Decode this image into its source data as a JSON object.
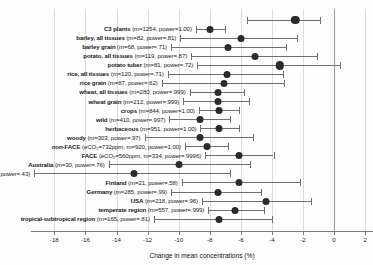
{
  "figure": {
    "xaxis_title": "Change in mean concentrations (%)",
    "tick_labels": [
      "-18",
      "-16",
      "-14",
      "-12",
      "-10",
      "-8",
      "-6",
      "-4",
      "-2",
      "0",
      "2"
    ],
    "colors": {
      "point": "#2b2b2b",
      "whisker": "#6f6f6f",
      "gridline": "#dcdcdc",
      "zeroline": "#9a9a9a",
      "axis": "#7b7b7b",
      "text": "#1b1b1b",
      "background": "#fdfdfd"
    }
  },
  "chart_data": {
    "type": "scatter",
    "title": "",
    "xlabel": "Change in mean concentrations (%)",
    "ylabel": "",
    "xlim": [
      -19.5,
      2.5
    ],
    "xticks": [
      -18,
      -16,
      -14,
      -12,
      -10,
      -8,
      -6,
      -4,
      -2,
      0,
      2
    ],
    "grid": true,
    "legend": false,
    "orientation": "horizontal-forest-plot",
    "reference_line": 0,
    "rows": [
      {
        "name": "",
        "stats": "",
        "label_bold": "",
        "label_rest": "",
        "value": -2.5,
        "low": -5.6,
        "high": -0.9,
        "marker": "large"
      },
      {
        "name": "C3 plants",
        "stats": "(m=1254, power=1.00)",
        "label_bold": "C3 plants",
        "label_rest": " (m=1254, power=1.00)",
        "value": -8.0,
        "low": -8.9,
        "high": -7.0,
        "marker": "normal"
      },
      {
        "name": "barley, all tissues",
        "stats": "(m=82, power=.81)",
        "label_bold": "barley, all tissues",
        "label_rest": " (m=82, power=.81)",
        "value": -6.0,
        "low": -9.9,
        "high": -2.4,
        "marker": "normal"
      },
      {
        "name": "barley grain",
        "stats": "(m=68, power=.71)",
        "label_bold": "barley grain",
        "label_rest": " (m=68, power=.71)",
        "value": -6.8,
        "low": -10.5,
        "high": -3.1,
        "marker": "normal"
      },
      {
        "name": "potato, all tissues",
        "stats": "(m=119, power=.87)",
        "label_bold": "potato, all tissues",
        "label_rest": " (m=119, power=.87)",
        "value": -5.1,
        "low": -9.2,
        "high": -1.1,
        "marker": "normal"
      },
      {
        "name": "potato tuber",
        "stats": "(m=81, power=.72)",
        "label_bold": "potato tuber",
        "label_rest": " (m=81, power=.72)",
        "value": -3.5,
        "low": -8.8,
        "high": 0.4,
        "marker": "large"
      },
      {
        "name": "rice, all tissues",
        "stats": "(m=120, power=.71)",
        "label_bold": "rice, all tissues",
        "label_rest": " (m=120, power=.71)",
        "value": -6.9,
        "low": -10.7,
        "high": -3.3,
        "marker": "normal"
      },
      {
        "name": "rice grain",
        "stats": "(m=87, power=.62)",
        "label_bold": "rice grain",
        "label_rest": " (m=87, power=.62)",
        "value": -7.1,
        "low": -11.1,
        "high": -3.2,
        "marker": "normal"
      },
      {
        "name": "wheat, all tissues",
        "stats": "(m=280, power=.999)",
        "label_bold": "wheat, all tissues",
        "label_rest": " (m=280, power=.999)",
        "value": -7.5,
        "low": -9.3,
        "high": -5.8,
        "marker": "normal"
      },
      {
        "name": "wheat grain",
        "stats": "(m=212, power=.999)",
        "label_bold": "wheat grain",
        "label_rest": " (m=212, power=.999)",
        "value": -7.5,
        "low": -9.7,
        "high": -5.5,
        "marker": "normal"
      },
      {
        "name": "crops",
        "stats": "(m=844, power=1.00)",
        "label_bold": "crops",
        "label_rest": " (m=844, power=1.00)",
        "value": -7.4,
        "low": -8.7,
        "high": -6.1,
        "marker": "normal"
      },
      {
        "name": "wild",
        "stats": "(m=410, power=.997)",
        "label_bold": "wild",
        "label_rest": " (m=410, power=.997)",
        "value": -8.6,
        "low": -10.6,
        "high": -6.7,
        "marker": "normal"
      },
      {
        "name": "herbaceous",
        "stats": "(m=951, power=1.00)",
        "label_bold": "herbaceous",
        "label_rest": " (m=951, power=1.00)",
        "value": -7.4,
        "low": -8.6,
        "high": -6.1,
        "marker": "normal"
      },
      {
        "name": "woody",
        "stats": "(m=303, power=.97)",
        "label_bold": "woody",
        "label_rest": " (m=303, power=.97)",
        "value": -8.6,
        "low": -12.2,
        "high": -5.2,
        "marker": "normal"
      },
      {
        "name": "non-FACE",
        "stats": "(eCO₂=732ppm, m=920, power=1.00)",
        "label_bold": "non-FACE",
        "label_rest": " (eCO₂=732ppm, m=920, power=1.00)",
        "value": -8.2,
        "low": -9.6,
        "high": -6.8,
        "marker": "normal"
      },
      {
        "name": "FACE",
        "stats": "(eCO₂=560ppm, m=334, power=.9996)",
        "label_bold": "FACE",
        "label_rest": " (eCO₂=560ppm, m=334, power=.9996)",
        "value": -6.1,
        "low": -8.3,
        "high": -3.9,
        "marker": "normal"
      },
      {
        "name": "Australia",
        "stats": "(m=30, power=.76)",
        "label_bold": "Australia",
        "label_rest": " (m=30, power=.76)",
        "value": -10.0,
        "low": -14.5,
        "high": -5.4,
        "marker": "normal"
      },
      {
        "name": "China",
        "stats": "(m=45, power=.43)",
        "label_bold": "China",
        "label_rest": " (m=45, power=.43)",
        "value": -12.9,
        "low": -19.3,
        "high": -6.7,
        "marker": "normal"
      },
      {
        "name": "Finland",
        "stats": "(m=21, power=.58)",
        "label_bold": "Finland",
        "label_rest": " (m=21, power=.58)",
        "value": -6.1,
        "low": -9.8,
        "high": -2.2,
        "marker": "normal"
      },
      {
        "name": "Germany",
        "stats": "(m=285, power=.99)",
        "label_bold": "Germany",
        "label_rest": " (m=285, power=.99)",
        "value": -7.5,
        "low": -10.5,
        "high": -4.7,
        "marker": "normal"
      },
      {
        "name": "USA",
        "stats": "(m=218, power=.96)",
        "label_bold": "USA",
        "label_rest": " (m=218, power=.96)",
        "value": -4.4,
        "low": -8.5,
        "high": -1.5,
        "marker": "normal"
      },
      {
        "name": "temperate region",
        "stats": "(m=557, power=.999)",
        "label_bold": "temperate region",
        "label_rest": " (m=557, power=.999)",
        "value": -6.4,
        "low": -8.1,
        "high": -4.5,
        "marker": "normal"
      },
      {
        "name": "tropical-subtropical region",
        "stats": "(m=165, power=.81)",
        "label_bold": "tropical-subtropical region",
        "label_rest": " (m=165, power=.81)",
        "value": -7.4,
        "low": -11.6,
        "high": -4.0,
        "marker": "normal"
      }
    ]
  }
}
